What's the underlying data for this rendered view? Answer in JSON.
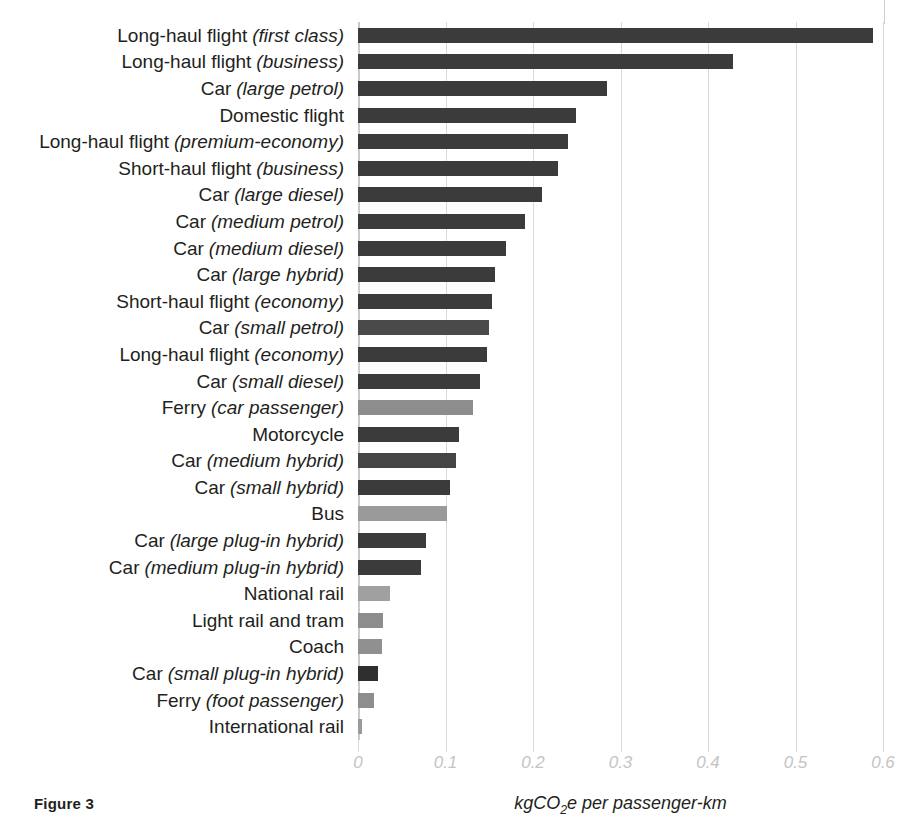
{
  "figure": {
    "caption": "Figure 3",
    "axis_title_prefix": "kgCO",
    "axis_title_sub": "2",
    "axis_title_suffix": "e per passenger-km"
  },
  "axis": {
    "tick_labels": [
      "0",
      "0.1",
      "0.2",
      "0.3",
      "0.4",
      "0.5",
      "0.6"
    ],
    "tick_values": [
      0,
      0.1,
      0.2,
      0.3,
      0.4,
      0.5,
      0.6
    ]
  },
  "colors": {
    "bar_dark": "#3b3b3b",
    "bar_mid": "#636363",
    "bar_light": "#8d8d8d",
    "gridline": "#d9d9d9",
    "tick_text": "#c4c4c4",
    "label_text": "#231f20"
  },
  "chart_data": {
    "type": "bar",
    "orientation": "horizontal",
    "title": "",
    "xlabel": "kgCO2e per passenger-km",
    "ylabel": "",
    "xlim": [
      0,
      0.6
    ],
    "grid": true,
    "legend": "none",
    "categories": [
      "Long-haul flight (first class)",
      "Long-haul flight (business)",
      "Car (large petrol)",
      "Domestic flight",
      "Long-haul flight (premium-economy)",
      "Short-haul flight (business)",
      "Car (large diesel)",
      "Car (medium petrol)",
      "Car (medium diesel)",
      "Car (large hybrid)",
      "Short-haul flight (economy)",
      "Car (small petrol)",
      "Long-haul flight (economy)",
      "Car (small diesel)",
      "Ferry (car passenger)",
      "Motorcycle",
      "Car (medium hybrid)",
      "Car (small hybrid)",
      "Bus",
      "Car (large plug-in hybrid)",
      "Car (medium plug-in hybrid)",
      "National rail",
      "Light rail and tram",
      "Coach",
      "Car (small plug-in hybrid)",
      "Ferry (foot passenger)",
      "International rail"
    ],
    "values": [
      0.588,
      0.428,
      0.284,
      0.249,
      0.24,
      0.229,
      0.21,
      0.191,
      0.169,
      0.156,
      0.153,
      0.15,
      0.147,
      0.139,
      0.131,
      0.115,
      0.112,
      0.105,
      0.102,
      0.078,
      0.072,
      0.036,
      0.028,
      0.027,
      0.023,
      0.018,
      0.004
    ]
  },
  "rows": [
    {
      "main": "Long-haul flight",
      "qual": "(first class)",
      "value": 0.588,
      "shade": "#3b3b3b"
    },
    {
      "main": "Long-haul flight",
      "qual": "(business)",
      "value": 0.428,
      "shade": "#3b3b3b"
    },
    {
      "main": "Car",
      "qual": "(large petrol)",
      "value": 0.284,
      "shade": "#3b3b3b"
    },
    {
      "main": "Domestic flight",
      "qual": "",
      "value": 0.249,
      "shade": "#3b3b3b"
    },
    {
      "main": "Long-haul flight",
      "qual": "(premium-economy)",
      "value": 0.24,
      "shade": "#3b3b3b"
    },
    {
      "main": "Short-haul flight",
      "qual": "(business)",
      "value": 0.229,
      "shade": "#3b3b3b"
    },
    {
      "main": "Car",
      "qual": "(large diesel)",
      "value": 0.21,
      "shade": "#3b3b3b"
    },
    {
      "main": "Car",
      "qual": "(medium petrol)",
      "value": 0.191,
      "shade": "#3b3b3b"
    },
    {
      "main": "Car",
      "qual": "(medium diesel)",
      "value": 0.169,
      "shade": "#3b3b3b"
    },
    {
      "main": "Car",
      "qual": "(large hybrid)",
      "value": 0.156,
      "shade": "#3b3b3b"
    },
    {
      "main": "Short-haul flight",
      "qual": "(economy)",
      "value": 0.153,
      "shade": "#3b3b3b"
    },
    {
      "main": "Car",
      "qual": "(small petrol)",
      "value": 0.15,
      "shade": "#4a4a4a"
    },
    {
      "main": "Long-haul flight",
      "qual": "(economy)",
      "value": 0.147,
      "shade": "#3b3b3b"
    },
    {
      "main": "Car",
      "qual": "(small diesel)",
      "value": 0.139,
      "shade": "#3b3b3b"
    },
    {
      "main": "Ferry",
      "qual": "(car passenger)",
      "value": 0.131,
      "shade": "#8d8d8d"
    },
    {
      "main": "Motorcycle",
      "qual": "",
      "value": 0.115,
      "shade": "#3b3b3b"
    },
    {
      "main": "Car",
      "qual": "(medium hybrid)",
      "value": 0.112,
      "shade": "#454545"
    },
    {
      "main": "Car",
      "qual": "(small hybrid)",
      "value": 0.105,
      "shade": "#3b3b3b"
    },
    {
      "main": "Bus",
      "qual": "",
      "value": 0.102,
      "shade": "#9a9a9a"
    },
    {
      "main": "Car",
      "qual": "(large plug-in hybrid)",
      "value": 0.078,
      "shade": "#3b3b3b"
    },
    {
      "main": "Car",
      "qual": "(medium plug-in hybrid)",
      "value": 0.072,
      "shade": "#3b3b3b"
    },
    {
      "main": "National rail",
      "qual": "",
      "value": 0.036,
      "shade": "#a0a0a0"
    },
    {
      "main": "Light rail and tram",
      "qual": "",
      "value": 0.028,
      "shade": "#8d8d8d"
    },
    {
      "main": "Coach",
      "qual": "",
      "value": 0.027,
      "shade": "#909090"
    },
    {
      "main": "Car",
      "qual": "(small plug-in hybrid)",
      "value": 0.023,
      "shade": "#2f2f2f"
    },
    {
      "main": "Ferry",
      "qual": "(foot passenger)",
      "value": 0.018,
      "shade": "#8d8d8d"
    },
    {
      "main": "International rail",
      "qual": "",
      "value": 0.004,
      "shade": "#9a9a9a"
    }
  ]
}
